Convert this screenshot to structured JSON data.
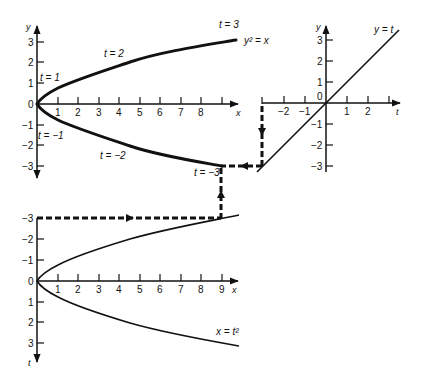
{
  "figure": {
    "panels": {
      "top_left": {
        "curve_label": "y² = x",
        "x_axis_label": "x",
        "y_axis_label": "y",
        "x_ticks": [
          "1",
          "2",
          "3",
          "4",
          "5",
          "6",
          "7",
          "8"
        ],
        "y_ticks": [
          "3",
          "2",
          "1",
          "0",
          "−1",
          "−2",
          "−3"
        ],
        "annotations": {
          "t3": "t = 3",
          "t2": "t = 2",
          "t1": "t = 1",
          "tm1": "t = −1",
          "tm2": "t = −2",
          "tm3": "t = −3"
        }
      },
      "top_right": {
        "curve_label": "y = t",
        "x_axis_label": "t",
        "y_axis_label": "y",
        "t_ticks": [
          "−2",
          "−1",
          "1",
          "2"
        ],
        "y_ticks": [
          "3",
          "2",
          "1",
          "0",
          "−1",
          "−2",
          "−3"
        ]
      },
      "bottom": {
        "curve_label": "x = t²",
        "x_axis_label": "x",
        "t_axis_label": "t",
        "x_ticks": [
          "1",
          "2",
          "3",
          "4",
          "5",
          "6",
          "7",
          "8",
          "9"
        ],
        "t_ticks": [
          "−3",
          "−2",
          "−1",
          "0",
          "1",
          "2",
          "3"
        ]
      }
    },
    "colors": {
      "ink": "#111111",
      "background": "#ffffff"
    }
  }
}
